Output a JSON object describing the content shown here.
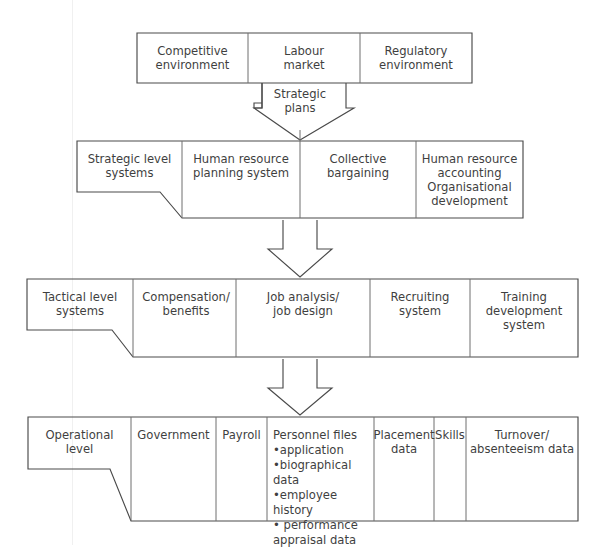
{
  "diagram": {
    "type": "flow-hierarchy",
    "stroke_color": "#4a4a4a",
    "background_color": "#ffffff",
    "rows": [
      {
        "id": "environment",
        "level_label": null,
        "cells": [
          {
            "id": "competitive-environment",
            "text": "Competitive\nenvironment"
          },
          {
            "id": "labour-market",
            "text": "Labour\nmarket"
          },
          {
            "id": "regulatory-environment",
            "text": "Regulatory\nenvironment"
          }
        ]
      },
      {
        "id": "strategic",
        "level_label": "Strategic level\nsystems",
        "cells": [
          {
            "id": "human-resource-planning-system",
            "text": "Human resource\nplanning system"
          },
          {
            "id": "collective-bargaining",
            "text": "Collective\nbargaining"
          },
          {
            "id": "human-resource-accounting",
            "text": "Human resource\naccounting\nOrganisational\ndevelopment"
          }
        ]
      },
      {
        "id": "tactical",
        "level_label": "Tactical level\nsystems",
        "cells": [
          {
            "id": "compensation-benefits",
            "text": "Compensation/\nbenefits"
          },
          {
            "id": "job-analysis-job-design",
            "text": "Job analysis/\njob design"
          },
          {
            "id": "recruiting-system",
            "text": "Recruiting\nsystem"
          },
          {
            "id": "training-development-system",
            "text": "Training\ndevelopment\nsystem"
          }
        ]
      },
      {
        "id": "operational",
        "level_label": "Operational\nlevel",
        "cells": [
          {
            "id": "government",
            "text": "Government"
          },
          {
            "id": "payroll",
            "text": "Payroll"
          },
          {
            "id": "personnel-files",
            "text": "Personnel files"
          },
          {
            "id": "placement-data",
            "text": "Placement\ndata"
          },
          {
            "id": "skills",
            "text": "Skills"
          },
          {
            "id": "turnover-absenteeism-data",
            "text": "Turnover/\nabsenteeism data"
          }
        ]
      }
    ],
    "personnel_files": {
      "title": "Personnel files",
      "items": [
        "•application",
        "•biographical data",
        "•employee history",
        "•  performance\nappraisal data"
      ]
    },
    "connectors": [
      {
        "id": "strategic-plans-arrow",
        "label": "Strategic\nplans",
        "from": "environment",
        "to": "strategic"
      },
      {
        "id": "strategic-to-tactical-arrow",
        "label": "",
        "from": "strategic",
        "to": "tactical"
      },
      {
        "id": "tactical-to-operational-arrow",
        "label": "",
        "from": "tactical",
        "to": "operational"
      }
    ]
  }
}
